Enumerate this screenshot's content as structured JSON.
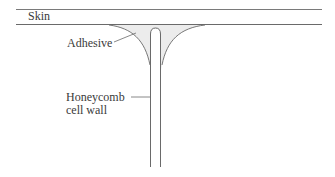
{
  "diagram": {
    "labels": {
      "skin": "Skin",
      "adhesive": "Adhesive",
      "wall_line1": "Honeycomb",
      "wall_line2": "cell wall"
    },
    "colors": {
      "line": "#6a6a6a",
      "adhesive_fill": "#ececec",
      "text": "#3a3a3a"
    }
  }
}
